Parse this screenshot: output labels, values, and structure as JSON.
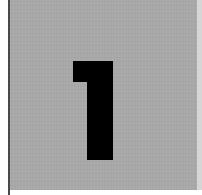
{
  "tile": {
    "numeral": "1",
    "background_color": "#a8a8a8",
    "numeral_color": "#000000",
    "border_color": "#4a4a4a"
  }
}
